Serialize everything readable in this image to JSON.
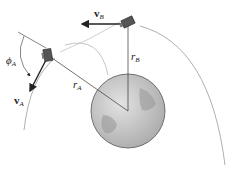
{
  "labels": {
    "vB": {
      "main": "v",
      "sub": "B"
    },
    "vA": {
      "main": "v",
      "sub": "A"
    },
    "phiA": {
      "main": "ϕ",
      "sub": "A"
    },
    "rA": {
      "main": "r",
      "sub": "A"
    },
    "rB": {
      "main": "r",
      "sub": "B"
    }
  },
  "colors": {
    "earth_fill": "#bdbdbd",
    "earth_stroke": "#555555",
    "orbit": "#9a9a9a",
    "vector": "#222222"
  }
}
